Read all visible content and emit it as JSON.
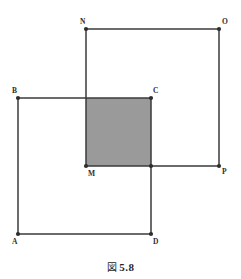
{
  "figure": {
    "caption_mark": "図",
    "caption_number": "5.8",
    "canvas": {
      "width": 241,
      "height": 279
    },
    "style": {
      "background": "#ffffff",
      "stroke": "#3a3a3a",
      "stroke_width": 1.5,
      "vertex_dot_color": "#2e2e2e",
      "vertex_dot_radius": 2.1,
      "shaded_fill": "#9a9a9a",
      "shaded_stroke": "#3a3a3a",
      "label_color": "#2e2e2e"
    },
    "points": {
      "A": {
        "x": 18,
        "y": 234,
        "label": "A",
        "label_x": 12,
        "label_y": 238
      },
      "B": {
        "x": 18,
        "y": 98,
        "label": "B",
        "label_x": 12,
        "label_y": 87
      },
      "C": {
        "x": 151,
        "y": 98,
        "label": "C",
        "label_x": 153,
        "label_y": 87
      },
      "D": {
        "x": 151,
        "y": 234,
        "label": "D",
        "label_x": 153,
        "label_y": 238
      },
      "M": {
        "x": 86,
        "y": 166,
        "label": "M",
        "label_x": 88,
        "label_y": 170
      },
      "N": {
        "x": 86,
        "y": 29,
        "label": "N",
        "label_x": 80,
        "label_y": 18
      },
      "O": {
        "x": 219,
        "y": 29,
        "label": "O",
        "label_x": 222,
        "label_y": 18
      },
      "P": {
        "x": 219,
        "y": 166,
        "label": "P",
        "label_x": 222,
        "label_y": 168
      }
    },
    "squares": [
      {
        "name": "square-ABCD",
        "vertices": [
          "A",
          "B",
          "C",
          "D"
        ],
        "filled": false
      },
      {
        "name": "square-MNOP",
        "vertices": [
          "M",
          "N",
          "O",
          "P"
        ],
        "filled": false
      }
    ],
    "shaded_region": {
      "name": "overlap-square-MBCP",
      "corners": [
        "M",
        "top-left-overlap",
        "C",
        "right-overlap"
      ],
      "x": 86,
      "y": 98,
      "width": 65,
      "height": 68
    }
  }
}
